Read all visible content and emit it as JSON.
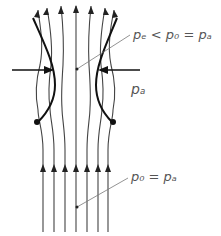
{
  "diagram": {
    "labels": {
      "throat_pressure": "pₑ < p₀ = pₐ",
      "ambient_pressure": "pₐ",
      "inlet_pressure": "p₀ = pₐ"
    },
    "colors": {
      "line": "#333333",
      "boundary": "#111111",
      "text": "#555555"
    }
  }
}
